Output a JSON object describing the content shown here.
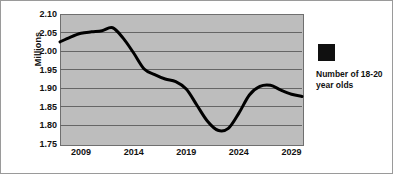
{
  "chart_data": {
    "type": "line",
    "title": "",
    "xlabel": "",
    "ylabel": "Millions",
    "ylim": [
      1.75,
      2.1
    ],
    "xlim": [
      2007,
      2030
    ],
    "grid": true,
    "legend_position": "right",
    "series": [
      {
        "name": "Number of 18-20 year olds",
        "color": "#000000",
        "x": [
          2007,
          2008,
          2009,
          2010,
          2011,
          2012,
          2013,
          2014,
          2015,
          2016,
          2017,
          2018,
          2019,
          2020,
          2021,
          2022,
          2023,
          2024,
          2025,
          2026,
          2027,
          2028,
          2029,
          2030
        ],
        "values": [
          2.025,
          2.038,
          2.048,
          2.052,
          2.055,
          2.063,
          2.035,
          1.995,
          1.952,
          1.937,
          1.925,
          1.918,
          1.898,
          1.855,
          1.812,
          1.787,
          1.792,
          1.833,
          1.882,
          1.905,
          1.908,
          1.895,
          1.884,
          1.878
        ]
      }
    ],
    "y_ticks": [
      "2.10",
      "2.05",
      "2.00",
      "1.95",
      "1.90",
      "1.85",
      "1.80",
      "1.75"
    ],
    "y_tick_values": [
      2.1,
      2.05,
      2.0,
      1.95,
      1.9,
      1.85,
      1.8,
      1.75
    ],
    "x_ticks": [
      "2009",
      "2014",
      "2019",
      "2024",
      "2029"
    ],
    "x_tick_values": [
      2009,
      2014,
      2019,
      2024,
      2029
    ],
    "plot_background": "#bdbdbd",
    "gridline_color": "#666666",
    "line_width": 3
  },
  "axis": {
    "y_title": "Millions"
  },
  "legend": {
    "label": "Number of 18-20 year olds",
    "swatch_color": "#101010"
  }
}
